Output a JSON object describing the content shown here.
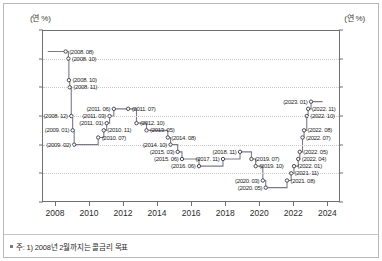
{
  "axis": {
    "unit_left": "(연 %)",
    "unit_right": "(연 %)",
    "y_ticks": [
      "6.0",
      "5.0",
      "4.0",
      "3.0",
      "2.0",
      "1.0",
      "0.0"
    ],
    "x_ticks": [
      "2008",
      "2010",
      "2012",
      "2014",
      "2016",
      "2018",
      "2020",
      "2022",
      "2024"
    ]
  },
  "footnote": "주: 1) 2008년 2월까지는 콜금리 목표",
  "colors": {
    "line": "#7a7a8c",
    "marker_edge": "#4a4a55",
    "axis": "#6f6f6f",
    "grid": "#c9c9c9"
  },
  "chart_data": {
    "type": "line",
    "title": "",
    "xlabel": "",
    "ylabel": "(연 %)",
    "xlim": [
      2007.3,
      2024.8
    ],
    "ylim": [
      0.0,
      6.0
    ],
    "grid": true,
    "legend": "none",
    "step": "post",
    "series": [
      {
        "name": "기준금리",
        "points": [
          {
            "label": "(2008. 08)",
            "x": 2008.63,
            "y": 5.25,
            "side": "right"
          },
          {
            "label": "(2008. 10)",
            "x": 2008.79,
            "y": 5.0,
            "side": "right"
          },
          {
            "label": "(2008. 10)",
            "x": 2008.82,
            "y": 4.25,
            "side": "right"
          },
          {
            "label": "(2008. 11)",
            "x": 2008.87,
            "y": 4.0,
            "side": "right"
          },
          {
            "label": "(2008. 12)",
            "x": 2008.96,
            "y": 3.0,
            "side": "left"
          },
          {
            "label": "(2009. 01)",
            "x": 2009.04,
            "y": 2.5,
            "side": "left"
          },
          {
            "label": "(2009. 02)",
            "x": 2009.13,
            "y": 2.0,
            "side": "left"
          },
          {
            "label": "(2010. 07)",
            "x": 2010.54,
            "y": 2.25,
            "side": "right"
          },
          {
            "label": "(2010. 11)",
            "x": 2010.87,
            "y": 2.5,
            "side": "right"
          },
          {
            "label": "(2011. 01)",
            "x": 2011.04,
            "y": 2.75,
            "side": "left"
          },
          {
            "label": "(2011. 03)",
            "x": 2011.21,
            "y": 3.0,
            "side": "left"
          },
          {
            "label": "(2011. 06)",
            "x": 2011.46,
            "y": 3.25,
            "side": "left"
          },
          {
            "label": "(2011. 07)",
            "x": 2012.3,
            "y": 3.25,
            "side": "right"
          },
          {
            "label": "(2012. 10)",
            "x": 2012.79,
            "y": 2.75,
            "side": "right"
          },
          {
            "label": "(2013. 05)",
            "x": 2013.38,
            "y": 2.5,
            "side": "right"
          },
          {
            "label": "(2014. 08)",
            "x": 2014.63,
            "y": 2.25,
            "side": "right"
          },
          {
            "label": "(2014. 10)",
            "x": 2014.79,
            "y": 2.0,
            "side": "left"
          },
          {
            "label": "(2015. 03)",
            "x": 2015.21,
            "y": 1.75,
            "side": "left"
          },
          {
            "label": "(2015. 06)",
            "x": 2015.46,
            "y": 1.5,
            "side": "left"
          },
          {
            "label": "(2016. 06)",
            "x": 2016.46,
            "y": 1.25,
            "side": "left"
          },
          {
            "label": "(2017. 11)",
            "x": 2017.87,
            "y": 1.5,
            "side": "left"
          },
          {
            "label": "(2018. 11)",
            "x": 2018.87,
            "y": 1.75,
            "side": "left"
          },
          {
            "label": "(2019. 07)",
            "x": 2019.54,
            "y": 1.5,
            "side": "right"
          },
          {
            "label": "(2019. 10)",
            "x": 2019.79,
            "y": 1.25,
            "side": "right"
          },
          {
            "label": "(2020. 03)",
            "x": 2020.21,
            "y": 0.75,
            "side": "left"
          },
          {
            "label": "(2020. 05)",
            "x": 2020.38,
            "y": 0.5,
            "side": "left"
          },
          {
            "label": "(2021. 08)",
            "x": 2021.63,
            "y": 0.75,
            "side": "right"
          },
          {
            "label": "(2021. 11)",
            "x": 2021.87,
            "y": 1.0,
            "side": "right"
          },
          {
            "label": "(2022. 01)",
            "x": 2022.04,
            "y": 1.25,
            "side": "right"
          },
          {
            "label": "(2022. 04)",
            "x": 2022.29,
            "y": 1.5,
            "side": "right"
          },
          {
            "label": "(2022. 05)",
            "x": 2022.38,
            "y": 1.75,
            "side": "right"
          },
          {
            "label": "(2022. 07)",
            "x": 2022.54,
            "y": 2.25,
            "side": "right"
          },
          {
            "label": "(2022. 08)",
            "x": 2022.63,
            "y": 2.5,
            "side": "right"
          },
          {
            "label": "(2022. 10)",
            "x": 2022.79,
            "y": 3.0,
            "side": "right"
          },
          {
            "label": "(2022. 11)",
            "x": 2022.87,
            "y": 3.25,
            "side": "right"
          },
          {
            "label": "(2023. 01)",
            "x": 2023.04,
            "y": 3.5,
            "side": "left"
          }
        ],
        "head_x": 2023.72,
        "tail_x": 2007.58,
        "tail_y": 5.25
      }
    ]
  }
}
